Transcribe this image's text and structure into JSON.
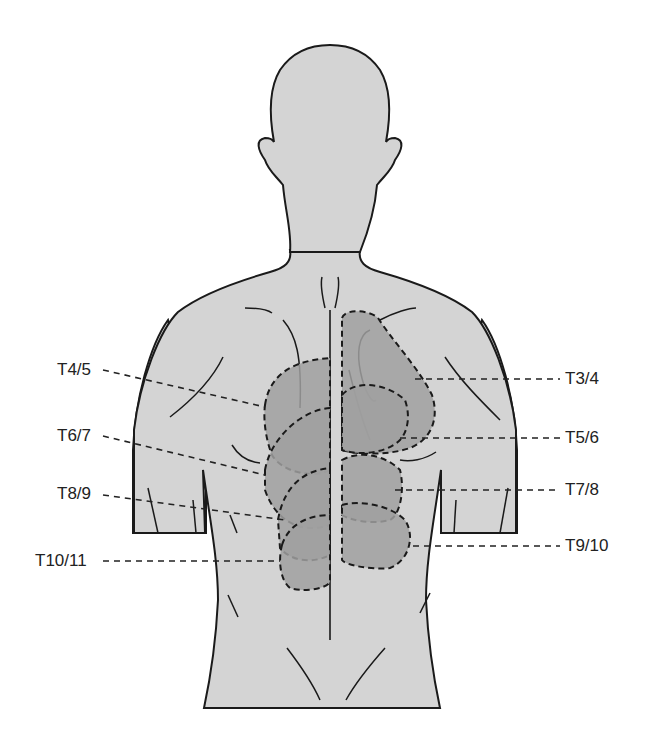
{
  "figure": {
    "colors": {
      "background": "#ffffff",
      "body_fill": "#d4d4d4",
      "region_fill": "#a0a0a0",
      "outline": "#1a1a1a",
      "leader_line": "#222222"
    }
  },
  "labels": {
    "left": [
      {
        "id": "t4-5",
        "text": "T4/5"
      },
      {
        "id": "t6-7",
        "text": "T6/7"
      },
      {
        "id": "t8-9",
        "text": "T8/9"
      },
      {
        "id": "t10-11",
        "text": "T10/11"
      }
    ],
    "right": [
      {
        "id": "t3-4",
        "text": "T3/4"
      },
      {
        "id": "t5-6",
        "text": "T5/6"
      },
      {
        "id": "t7-8",
        "text": "T7/8"
      },
      {
        "id": "t9-10",
        "text": "T9/10"
      }
    ]
  }
}
